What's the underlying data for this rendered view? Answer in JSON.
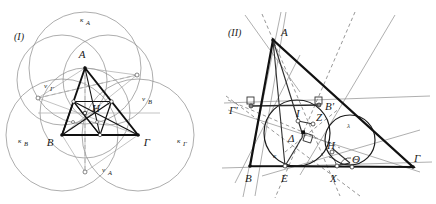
{
  "figure": {
    "panels": [
      {
        "id": "panel-1",
        "caption": "(I)",
        "description": "Triangle ABГ with three equal circles centered at the vertices meeting at a common point, the medial triangle and the common point H",
        "points": [
          {
            "name": "A",
            "label": "A",
            "x": 85,
            "y": 68
          },
          {
            "name": "B",
            "label": "B",
            "x": 62,
            "y": 135
          },
          {
            "name": "G",
            "label": "Γ",
            "x": 138,
            "y": 135
          },
          {
            "name": "H",
            "label": "H",
            "x": 85,
            "y": 113
          },
          {
            "name": "nuA",
            "label": "ν",
            "sub": "A",
            "x": 85,
            "y": 172
          },
          {
            "name": "nuB",
            "label": "ν",
            "sub": "B",
            "x": 137,
            "y": 75
          },
          {
            "name": "nuG",
            "label": "ν",
            "sub": "Γ",
            "x": 38,
            "y": 98
          }
        ],
        "circles": [
          {
            "name": "kappa-A",
            "label": "κ",
            "sub": "A",
            "cx": 85,
            "cy": 68,
            "r": 56
          },
          {
            "name": "kappa-B",
            "label": "κ",
            "sub": "B",
            "cx": 62,
            "cy": 135,
            "r": 56
          },
          {
            "name": "kappa-G",
            "label": "κ",
            "sub": "Γ",
            "cx": 138,
            "cy": 135,
            "r": 56
          }
        ],
        "label_positions": [
          {
            "name": "kappa-A-label",
            "x": 83,
            "y": 22
          },
          {
            "name": "kappa-B-label",
            "x": 22,
            "y": 143
          },
          {
            "name": "kappa-G-label",
            "x": 181,
            "y": 143
          },
          {
            "name": "nuA-label",
            "x": 106,
            "y": 172
          },
          {
            "name": "nuB-label",
            "x": 146,
            "y": 101
          },
          {
            "name": "nuG-label",
            "x": 48,
            "y": 88
          },
          {
            "name": "A-label",
            "x": 82,
            "y": 58
          },
          {
            "name": "B-label",
            "x": 50,
            "y": 146
          },
          {
            "name": "G-label",
            "x": 145,
            "y": 146
          },
          {
            "name": "H-label",
            "x": 89,
            "y": 112
          },
          {
            "name": "caption",
            "x": 14,
            "y": 40
          }
        ]
      },
      {
        "id": "panel-2",
        "caption": "(II)",
        "description": "Triangle ABГ with incircle kappa, circle lambda, angle bisectors, cevians and perpendicular feet",
        "points": [
          {
            "name": "A",
            "label": "A",
            "x": 273,
            "y": 40
          },
          {
            "name": "B",
            "label": "B",
            "x": 250,
            "y": 166
          },
          {
            "name": "G",
            "label": "Γ",
            "x": 413,
            "y": 167
          },
          {
            "name": "Gprime",
            "label": "Γ'",
            "x": 251,
            "y": 106
          },
          {
            "name": "Bprime",
            "label": "B'",
            "x": 321,
            "y": 105
          },
          {
            "name": "I",
            "label": "I",
            "x": 298,
            "y": 121
          },
          {
            "name": "Z",
            "label": "Z",
            "x": 313,
            "y": 124
          },
          {
            "name": "Delta",
            "label": "Δ",
            "x": 303,
            "y": 136
          },
          {
            "name": "H",
            "label": "H",
            "x": 333,
            "y": 149
          },
          {
            "name": "Theta",
            "label": "Θ",
            "x": 350,
            "y": 163
          },
          {
            "name": "E",
            "label": "E",
            "x": 285,
            "y": 166
          },
          {
            "name": "X",
            "label": "X",
            "x": 335,
            "y": 166
          }
        ],
        "circles": [
          {
            "name": "kappa",
            "label": "κ",
            "cx": 297,
            "cy": 133,
            "r": 33
          },
          {
            "name": "lambda",
            "label": "λ",
            "cx": 350,
            "cy": 140,
            "r": 25
          }
        ],
        "label_positions": [
          {
            "name": "caption",
            "x": 228,
            "y": 36
          },
          {
            "name": "A-label",
            "x": 281,
            "y": 34
          },
          {
            "name": "B-label",
            "x": 248,
            "y": 180
          },
          {
            "name": "G-label",
            "x": 414,
            "y": 163
          },
          {
            "name": "Gprime-label",
            "x": 230,
            "y": 112
          },
          {
            "name": "Bprime-label",
            "x": 327,
            "y": 109
          },
          {
            "name": "I-label",
            "x": 296,
            "y": 117
          },
          {
            "name": "Z-label",
            "x": 315,
            "y": 121
          },
          {
            "name": "Delta-label",
            "x": 291,
            "y": 141
          },
          {
            "name": "H-label",
            "x": 331,
            "y": 149
          },
          {
            "name": "Theta-label",
            "x": 352,
            "y": 163
          },
          {
            "name": "E-label",
            "x": 283,
            "y": 180
          },
          {
            "name": "X-label",
            "x": 331,
            "y": 180
          },
          {
            "name": "kappa-label",
            "x": 275,
            "y": 157
          },
          {
            "name": "lambda-label",
            "x": 348,
            "y": 127
          }
        ]
      }
    ]
  },
  "style": {
    "background": "#ffffff",
    "thick_stroke": "#111111",
    "thin_stroke": "#6f6f6f",
    "light_stroke": "#9a9a9a",
    "dashed_stroke": "#777777",
    "label_color": "#1a1a1a"
  }
}
